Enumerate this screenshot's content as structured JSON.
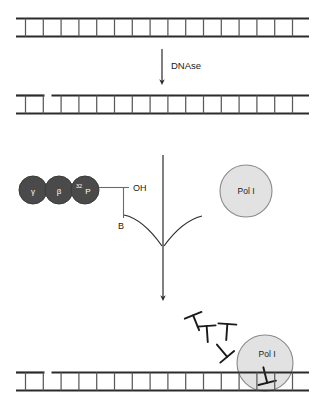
{
  "figure": {
    "steps": {
      "dnase_label": "DNAse",
      "substrate_label": "",
      "product_label": ""
    },
    "nucleotide": {
      "phosphates": [
        {
          "name": "gamma-phosphate",
          "label": "γ"
        },
        {
          "name": "beta-phosphate",
          "label": "β"
        },
        {
          "name": "alpha-phosphate-labeled",
          "label": "P",
          "superscript": "32"
        }
      ],
      "hydroxyl_label": "OH",
      "base_label": "B"
    },
    "enzymes": [
      {
        "name": "pol-i-free",
        "label": "Pol I"
      },
      {
        "name": "pol-i-bound",
        "label": "Pol I"
      }
    ],
    "strands": [
      {
        "name": "intact-duplex",
        "nicked": false,
        "rungs": 16
      },
      {
        "name": "nicked-duplex",
        "nicked": true,
        "rungs": 16,
        "nick_after_rung": 2
      },
      {
        "name": "translated-duplex",
        "nicked": true,
        "rungs": 16,
        "nick_after_rung": 2
      }
    ],
    "released_nucleotides_count": 4,
    "colors": {
      "backbone": "#2b2b2b",
      "rung": "#5a5a5a",
      "phosphate_fill": "#4a4a4a",
      "phosphate_stroke": "#3a3a3a",
      "enzyme_fill": "#e2e2e2",
      "enzyme_stroke": "#8a8a8a",
      "arrow": "#2b2b2b",
      "text": "#1a1a1a",
      "bond": "#6a6a6a"
    }
  }
}
